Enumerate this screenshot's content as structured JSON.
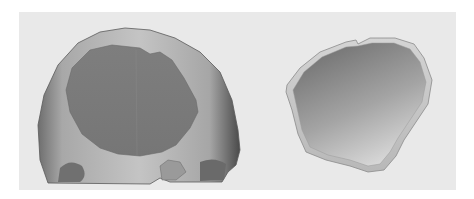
{
  "figure": {
    "panels": [
      {
        "id": "skull",
        "label": "Skull with cranial defect"
      },
      {
        "id": "implant",
        "label": "Cranial implant"
      }
    ],
    "colors": {
      "background": "#ffffff",
      "panel": "#e9e9e9",
      "skull_surface": "#b4b4b4",
      "skull_shadow": "#5a5a5a",
      "defect_region": "#7a7a7a",
      "implant_rim": "#c8c8c8",
      "implant_inner": "#8e8e8e"
    }
  }
}
